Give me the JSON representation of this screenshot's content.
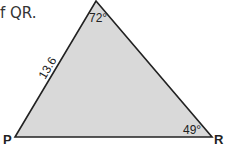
{
  "prompt_text": "f QR.",
  "triangle": {
    "fill": "#d9d9d9",
    "stroke": "#222222",
    "vertices": {
      "P": "P",
      "R": "R",
      "Q": ""
    },
    "side_label_PQ": "13.6",
    "angle_Q": "72°",
    "angle_R": "49°"
  }
}
